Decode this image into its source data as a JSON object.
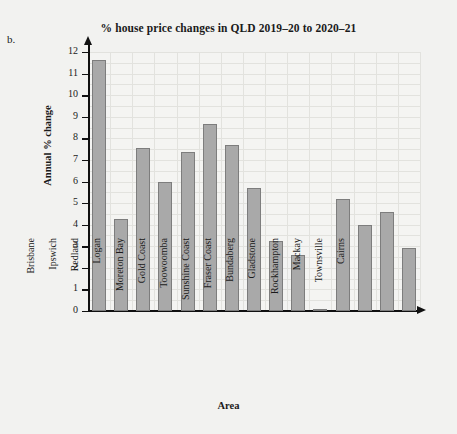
{
  "figure_label": "b.",
  "chart_data": {
    "type": "bar",
    "title": "% house price changes in QLD 2019–20 to 2020–21",
    "xlabel": "Area",
    "ylabel": "Annual % change",
    "ylim": [
      0,
      12
    ],
    "ytick_labels": [
      "0",
      "1",
      "2",
      "3",
      "4",
      "5",
      "6",
      "7",
      "8",
      "9",
      "10",
      "11",
      "12"
    ],
    "grid": true,
    "legend": null,
    "categories": [
      "Brisbane",
      "Ipswich",
      "Redland",
      "Logan",
      "Moreton Bay",
      "Gold Coast",
      "Toowoomba",
      "Sunshine Coast",
      "Fraser Coast",
      "Bundaberg",
      "Gladstone",
      "Rockhampton",
      "Mackay",
      "Townsville",
      "Cairns"
    ],
    "values": [
      11.65,
      4.25,
      7.55,
      6.0,
      7.35,
      8.65,
      7.7,
      5.7,
      3.25,
      2.6,
      0.1,
      5.2,
      4.0,
      4.6,
      2.9
    ],
    "bar_color": "#a9a9a9",
    "bar_edge_color": "#7d7d7d"
  }
}
